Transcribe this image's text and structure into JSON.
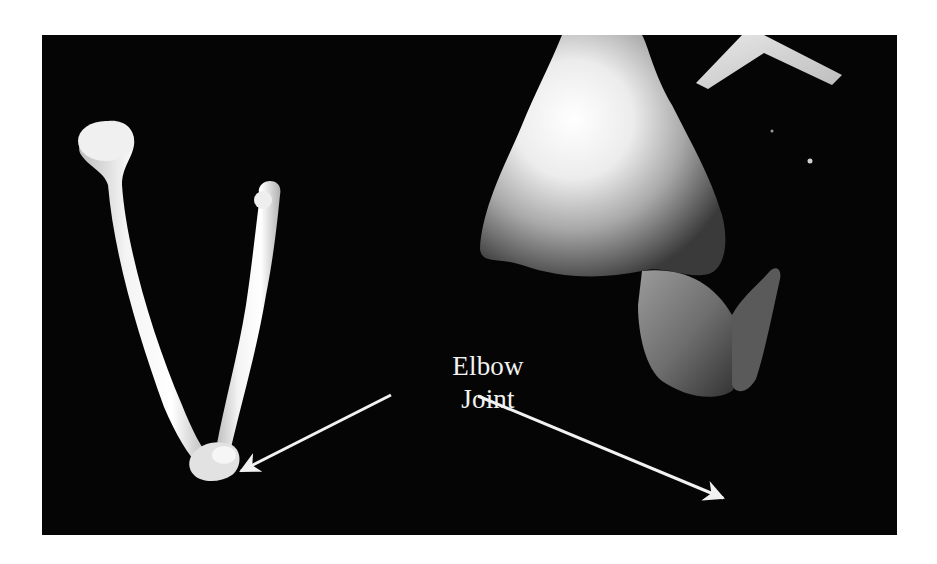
{
  "figure": {
    "annotation": {
      "line1": "Elbow",
      "line2": "Joint"
    },
    "panels": [
      {
        "name": "forearm-bones",
        "description": "radius and ulna skeleton bones"
      },
      {
        "name": "flexed-arm",
        "description": "photograph of flexed human arm at elbow"
      }
    ],
    "arrows": [
      {
        "name": "arrow-to-bones",
        "target": "forearm-bones"
      },
      {
        "name": "arrow-to-arm",
        "target": "flexed-arm"
      }
    ],
    "colors": {
      "background": "#050505",
      "foreground": "#f2f2f2",
      "page": "#ffffff"
    }
  }
}
